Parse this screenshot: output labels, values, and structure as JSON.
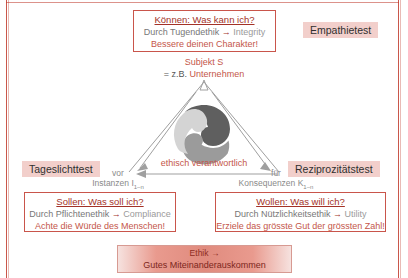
{
  "frame": {
    "accent_color": "#c0392b",
    "box_border_color": "#c9554b",
    "label_bg_color": "#f2cfcb",
    "heading_color": "#a33228",
    "body_color": "#777777",
    "emphasis_color": "#c4564a"
  },
  "boxes": {
    "top": {
      "name": "koennen-box",
      "heading": "Können: Was kann ich?",
      "method_prefix": "Durch Tugendethik",
      "arrow": "→",
      "method_result": "Integrity",
      "imperative": "Bessere deinen Charakter!"
    },
    "bottom_left": {
      "name": "sollen-box",
      "heading": "Sollen: Was soll ich?",
      "method_prefix": "Durch Pflichtenethik",
      "arrow": "→",
      "method_result": "Compliance",
      "imperative": "Achte die Würde des Menschen!"
    },
    "bottom_right": {
      "name": "wollen-box",
      "heading": "Wollen: Was will ich?",
      "method_prefix": "Durch Nützlichkeitsethik",
      "arrow": "→",
      "method_result": "Utility",
      "imperative": "Erziele das grösste Gut der grössten Zahl!"
    }
  },
  "test_labels": {
    "empathy": "Empathietest",
    "daylight": "Tageslichttest",
    "reciprocity": "Reziprozitätstest"
  },
  "subject": {
    "line1": "Subjekt S",
    "line2_prefix": "= z.B.",
    "line2_emphasis": "Unternehmen"
  },
  "center": {
    "caption": "ethisch verantwortlich",
    "logo_icon": "triskelion-swirl-icon"
  },
  "side_captions": {
    "left": {
      "line1": "vor",
      "line2_text": "Instanzen I",
      "line2_sub": "1–n"
    },
    "right": {
      "line1": "für",
      "line2_text": "Konsequenzen K",
      "line2_sub": "1–n"
    }
  },
  "ethik_box": {
    "line1_label": "Ethik",
    "line1_arrow": "→",
    "line2": "Gutes Miteinanderauskommen"
  }
}
